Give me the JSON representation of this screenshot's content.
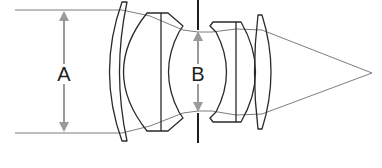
{
  "diagram": {
    "type": "optical-lens-cross-section",
    "labels": {
      "entrance_diameter": "A",
      "stop_diameter": "B"
    },
    "colors": {
      "lens_outline": "#2a2a2a",
      "ray": "#6e6e6e",
      "aperture_stop": "#1e1e1e",
      "dimension_arrow": "#9a9a9a",
      "background": "#ffffff"
    },
    "elements": [
      {
        "name": "front-meniscus-lens"
      },
      {
        "name": "front-cemented-group"
      },
      {
        "name": "aperture-stop"
      },
      {
        "name": "rear-cemented-group"
      },
      {
        "name": "rear-lens"
      }
    ]
  }
}
